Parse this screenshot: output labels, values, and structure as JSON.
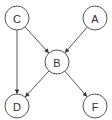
{
  "diagram": {
    "type": "directed-graph",
    "nodes": [
      {
        "id": "C",
        "label": "C",
        "x": 17,
        "y": 18,
        "r": 12
      },
      {
        "id": "A",
        "label": "A",
        "x": 95,
        "y": 18,
        "r": 12
      },
      {
        "id": "B",
        "label": "B",
        "x": 57,
        "y": 62,
        "r": 12
      },
      {
        "id": "D",
        "label": "D",
        "x": 17,
        "y": 106,
        "r": 12
      },
      {
        "id": "F",
        "label": "F",
        "x": 95,
        "y": 106,
        "r": 12
      }
    ],
    "edges": [
      {
        "from": "C",
        "to": "B"
      },
      {
        "from": "A",
        "to": "B"
      },
      {
        "from": "C",
        "to": "D"
      },
      {
        "from": "B",
        "to": "D"
      },
      {
        "from": "B",
        "to": "F"
      }
    ],
    "colors": {
      "node_stroke": "#555555",
      "node_fill": "#ffffff",
      "edge": "#444444",
      "label": "#333333"
    }
  }
}
